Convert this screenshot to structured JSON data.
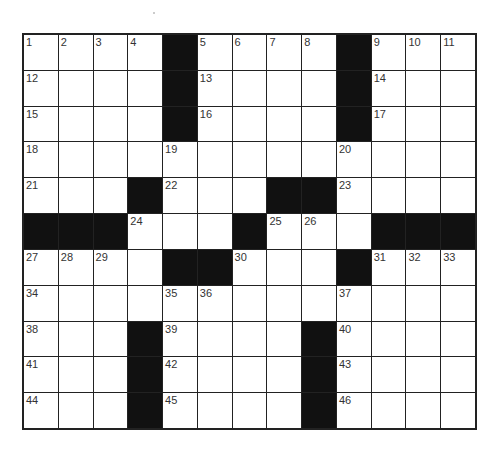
{
  "puzzle": {
    "rows": 11,
    "cols": 13,
    "grid": [
      [
        "1",
        "2",
        "3",
        "4",
        "#",
        "5",
        "6",
        "7",
        "8",
        "#",
        "9",
        "10",
        "11"
      ],
      [
        "12",
        "",
        "",
        "",
        "#",
        "13",
        "",
        "",
        "",
        "#",
        "14",
        "",
        ""
      ],
      [
        "15",
        "",
        "",
        "",
        "#",
        "16",
        "",
        "",
        "",
        "#",
        "17",
        "",
        ""
      ],
      [
        "18",
        "",
        "",
        "",
        "19",
        "",
        "",
        "",
        "",
        "20",
        "",
        "",
        ""
      ],
      [
        "21",
        "",
        "",
        "#",
        "22",
        "",
        "",
        "#",
        "#",
        "23",
        "",
        "",
        ""
      ],
      [
        "#",
        "#",
        "#",
        "24",
        "",
        "",
        "#",
        "25",
        "26",
        "",
        "#",
        "#",
        "#"
      ],
      [
        "27",
        "28",
        "29",
        "",
        "#",
        "#",
        "30",
        "",
        "",
        "#",
        "31",
        "32",
        "33"
      ],
      [
        "34",
        "",
        "",
        "",
        "35",
        "36",
        "",
        "",
        "",
        "37",
        "",
        "",
        ""
      ],
      [
        "38",
        "",
        "",
        "#",
        "39",
        "",
        "",
        "",
        "#",
        "40",
        "",
        "",
        ""
      ],
      [
        "41",
        "",
        "",
        "#",
        "42",
        "",
        "",
        "",
        "#",
        "43",
        "",
        "",
        ""
      ],
      [
        "44",
        "",
        "",
        "#",
        "45",
        "",
        "",
        "",
        "#",
        "46",
        "",
        "",
        ""
      ]
    ]
  }
}
